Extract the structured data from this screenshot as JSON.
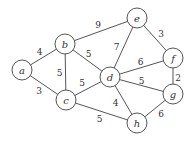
{
  "graph": {
    "nodes": [
      {
        "id": "a",
        "label": "a"
      },
      {
        "id": "b",
        "label": "b"
      },
      {
        "id": "c",
        "label": "c"
      },
      {
        "id": "d",
        "label": "d"
      },
      {
        "id": "e",
        "label": "e"
      },
      {
        "id": "f",
        "label": "f"
      },
      {
        "id": "g",
        "label": "g"
      },
      {
        "id": "h",
        "label": "h"
      }
    ],
    "edges": [
      {
        "from": "a",
        "to": "b",
        "weight": "4"
      },
      {
        "from": "a",
        "to": "c",
        "weight": "3"
      },
      {
        "from": "b",
        "to": "c",
        "weight": "5"
      },
      {
        "from": "b",
        "to": "d",
        "weight": "5"
      },
      {
        "from": "b",
        "to": "e",
        "weight": "9"
      },
      {
        "from": "c",
        "to": "d",
        "weight": "5"
      },
      {
        "from": "c",
        "to": "h",
        "weight": "5"
      },
      {
        "from": "d",
        "to": "e",
        "weight": "7"
      },
      {
        "from": "d",
        "to": "f",
        "weight": "6"
      },
      {
        "from": "d",
        "to": "g",
        "weight": "5"
      },
      {
        "from": "d",
        "to": "h",
        "weight": "4"
      },
      {
        "from": "e",
        "to": "f",
        "weight": "3"
      },
      {
        "from": "f",
        "to": "g",
        "weight": "2"
      },
      {
        "from": "g",
        "to": "h",
        "weight": "6"
      }
    ]
  }
}
